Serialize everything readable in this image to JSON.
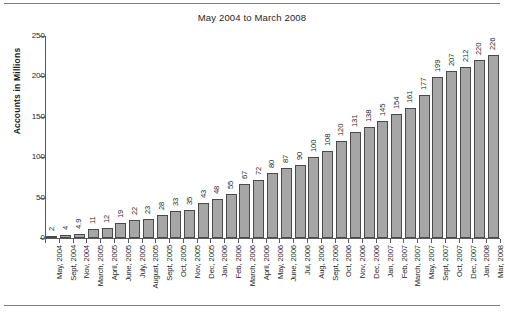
{
  "chart_data": {
    "type": "bar",
    "title": "May 2004 to March 2008",
    "xlabel": "",
    "ylabel": "Accounts in Millions",
    "ylim": [
      0,
      250
    ],
    "yticks": [
      0,
      50,
      100,
      150,
      200,
      250
    ],
    "grid": false,
    "legend": null,
    "bar_color": "#a6a6a6",
    "bar_border_color": "#4a4a4a",
    "value_labels_shown": true,
    "categories": [
      "May, 2004",
      "Sept, 2004",
      "Nov, 2004",
      "March, 2005",
      "April, 2005",
      "June, 2005",
      "July, 2005",
      "August, 2005",
      "Sept, 2005",
      "Oct, 2005",
      "Nov, 2005",
      "Dec, 2005",
      "Jan, 2006",
      "Feb, 2006",
      "March, 2006",
      "April, 2006",
      "May, 2006",
      "June, 2006",
      "Jul, 2006",
      "Aug, 2006",
      "Sept, 2006",
      "Oct, 2006",
      "Nov, 2006",
      "Dec, 2006",
      "Jan, 2007",
      "Feb, 2007",
      "March, 2007",
      "May, 2007",
      "Sept, 2007",
      "Oct, 2007",
      "Dec, 2007",
      "Jan, 2008",
      "Mar, 2008"
    ],
    "values": [
      2,
      4,
      4.9,
      11,
      12,
      19,
      22,
      23,
      28,
      33,
      35,
      43,
      48,
      55,
      67,
      72,
      80,
      87,
      90,
      100,
      108,
      120,
      131,
      138,
      145,
      154,
      161,
      177,
      199,
      207,
      212,
      220,
      226
    ],
    "value_labels": [
      "2",
      "4",
      "4.9",
      "11",
      "12",
      "19",
      "22",
      "23",
      "28",
      "33",
      "35",
      "43",
      "48",
      "55",
      "67",
      "72",
      "80",
      "87",
      "90",
      "100",
      "108",
      "120",
      "131",
      "138",
      "145",
      "154",
      "161",
      "177",
      "199",
      "207",
      "212",
      "220",
      "226"
    ]
  }
}
